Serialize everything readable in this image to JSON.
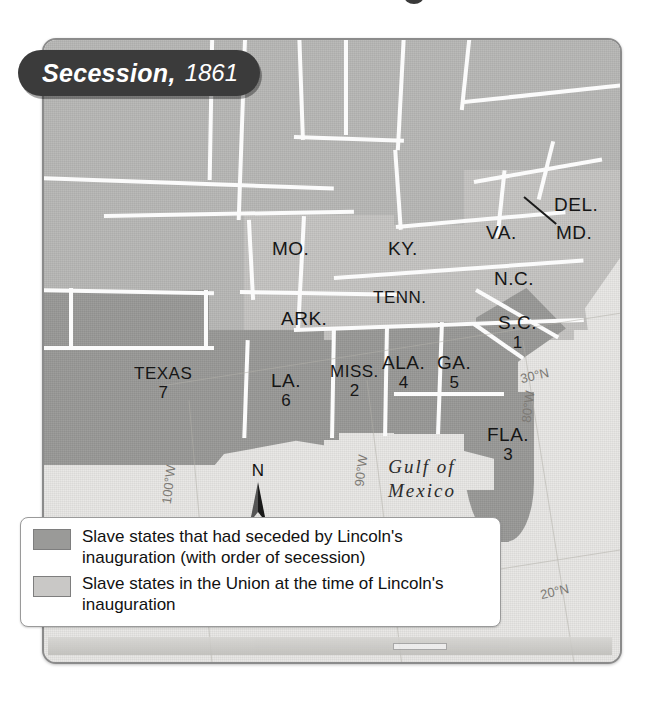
{
  "title": {
    "main": "Secession,",
    "year": "1861"
  },
  "map": {
    "ocean_label_line1": "Gulf of",
    "ocean_label_line2": "Mexico",
    "compass_label": "N",
    "compass_icon": "north-arrow-icon"
  },
  "graticule": {
    "labels": [
      {
        "text": "30°N",
        "left": 520,
        "top": 368,
        "rotate": -13
      },
      {
        "text": "20°N",
        "left": 540,
        "top": 584,
        "rotate": -13
      },
      {
        "text": "80°W",
        "left": 512,
        "top": 399,
        "rotate": -83
      },
      {
        "text": "90°W",
        "left": 345,
        "top": 463,
        "rotate": -83
      },
      {
        "text": "100°W",
        "left": 149,
        "top": 477,
        "rotate": -83
      }
    ]
  },
  "states": [
    {
      "name": "MO.",
      "number": "",
      "left": 272,
      "top": 238,
      "status": "union-slave"
    },
    {
      "name": "KY.",
      "number": "",
      "left": 388,
      "top": 238,
      "status": "union-slave"
    },
    {
      "name": "VA.",
      "number": "",
      "left": 486,
      "top": 222,
      "status": "union-slave"
    },
    {
      "name": "DEL.",
      "number": "",
      "left": 554,
      "top": 194,
      "status": "union-slave"
    },
    {
      "name": "MD.",
      "number": "",
      "left": 556,
      "top": 222,
      "status": "union-slave"
    },
    {
      "name": "N.C.",
      "number": "",
      "left": 494,
      "top": 268,
      "status": "union-slave"
    },
    {
      "name": "TENN.",
      "number": "",
      "left": 373,
      "top": 288,
      "status": "union-slave"
    },
    {
      "name": "ARK.",
      "number": "",
      "left": 281,
      "top": 308,
      "status": "union-slave"
    },
    {
      "name": "S.C.",
      "number": "1",
      "left": 498,
      "top": 312,
      "status": "seceded"
    },
    {
      "name": "MISS.",
      "number": "2",
      "left": 330,
      "top": 362,
      "status": "seceded"
    },
    {
      "name": "FLA.",
      "number": "3",
      "left": 487,
      "top": 424,
      "status": "seceded"
    },
    {
      "name": "ALA.",
      "number": "4",
      "left": 382,
      "top": 352,
      "status": "seceded"
    },
    {
      "name": "GA.",
      "number": "5",
      "left": 437,
      "top": 352,
      "status": "seceded"
    },
    {
      "name": "LA.",
      "number": "6",
      "left": 271,
      "top": 370,
      "status": "seceded"
    },
    {
      "name": "TEXAS",
      "number": "7",
      "left": 134,
      "top": 364,
      "status": "seceded"
    }
  ],
  "legend": {
    "rows": [
      {
        "swatch": "sw-seceded",
        "swatch_name": "legend-swatch-seceded",
        "text": "Slave states that had seceded by Lincoln's inauguration (with order of secession)"
      },
      {
        "swatch": "sw-union",
        "swatch_name": "legend-swatch-union",
        "text": "Slave states in the Union at the time of Lincoln's inauguration"
      }
    ]
  },
  "colors": {
    "seceded": "#9a9a98",
    "union_slave": "#c6c5c3",
    "north": "#b9b9b7",
    "ocean": "#e9e8e6",
    "banner": "#3b3b3b",
    "border": "#fbfbfb"
  }
}
